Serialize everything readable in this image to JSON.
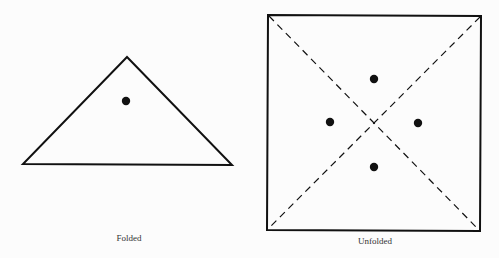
{
  "figures": [
    {
      "id": "folded",
      "caption": "Folded",
      "shape": "triangle",
      "dots": 1
    },
    {
      "id": "unfolded",
      "caption": "Unfolded",
      "shape": "square",
      "fold_lines": "two dashed diagonals",
      "dots": 4
    }
  ],
  "colors": {
    "stroke": "#111111",
    "background": "#fcfcfc"
  }
}
